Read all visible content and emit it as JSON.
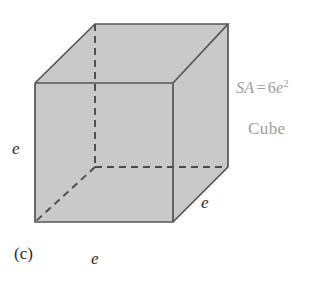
{
  "figure": {
    "part_label": "(c)",
    "shape_name": "Cube",
    "formula": {
      "quantity": "SA",
      "equals": "=",
      "coefficient": "6",
      "variable": "e",
      "exponent": "2",
      "full": "SA = 6e2"
    },
    "edge_labels": {
      "left": "e",
      "right": "e",
      "bottom": "e"
    },
    "colors": {
      "face_fill": "#c9c9c9",
      "edge_stroke": "#555555",
      "hidden_edge_stroke": "#4a4a4a",
      "annotation_text": "#9d9d9d",
      "label_text": "#2c2c2c",
      "background": "#ffffff"
    },
    "geometry": {
      "front_top_left": [
        35,
        83
      ],
      "front_top_right": [
        173,
        83
      ],
      "front_bottom_right": [
        173,
        222
      ],
      "front_bottom_left": [
        35,
        222
      ],
      "back_top_left": [
        95,
        24
      ],
      "back_top_right": [
        228,
        24
      ],
      "back_bottom_right": [
        228,
        167
      ],
      "back_bottom_left": [
        95,
        167
      ]
    }
  }
}
